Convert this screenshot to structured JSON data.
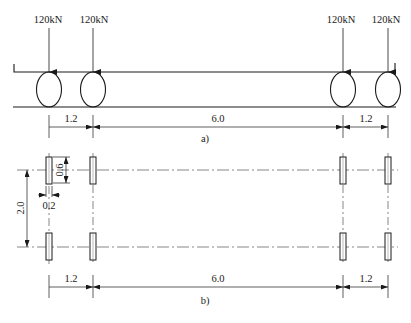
{
  "figure_a": {
    "caption": "a)",
    "loads": [
      {
        "label": "120kN"
      },
      {
        "label": "120kN"
      },
      {
        "label": "120kN"
      },
      {
        "label": "120kN"
      }
    ],
    "dimensions": [
      "1.2",
      "6.0",
      "1.2"
    ]
  },
  "figure_b": {
    "caption": "b)",
    "dimensions_bottom": [
      "1.2",
      "6.0",
      "1.2"
    ],
    "track_width_label": "2.0",
    "wheel_length_label": "0.6",
    "wheel_width_label": "0.2"
  },
  "colors": {
    "line": "#1a1a1a",
    "background": "#ffffff"
  }
}
